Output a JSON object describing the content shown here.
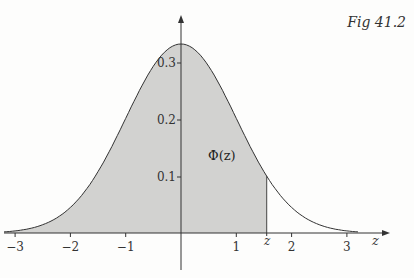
{
  "figure": {
    "caption": "Fig 41.2",
    "area_label": "Φ(z)",
    "x_axis_label": "z",
    "z_marker_label": "z"
  },
  "chart_data": {
    "type": "area",
    "xlabel": "z",
    "ylabel": "",
    "x_ticks": [
      "-3",
      "-2",
      "-1",
      "1",
      "2",
      "3"
    ],
    "y_ticks": [
      "0.1",
      "0.2",
      "0.3"
    ],
    "xlim": [
      -3,
      3.3
    ],
    "ylim": [
      0,
      0.4
    ],
    "z_value": 1.55,
    "shaded_region": "from -inf to z",
    "annotation": "Φ(z)",
    "curve": "standard normal pdf, peak ≈ 0.34 as drawn"
  },
  "colors": {
    "shade": "#cfcfcf",
    "curve": "#333333",
    "axis": "#333333"
  }
}
